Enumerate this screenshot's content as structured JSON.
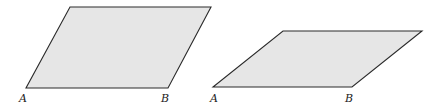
{
  "figure": {
    "fill_color": "#e6e6e6",
    "stroke_color": "#2a2a2a",
    "parallelograms": [
      {
        "id": "left",
        "points": "26,88 168,88 211,7 70,7",
        "labels": [
          {
            "text": "A",
            "x": 19,
            "y": 102
          },
          {
            "text": "B",
            "x": 161,
            "y": 102
          }
        ]
      },
      {
        "id": "right",
        "points": "213,87 352,87 422,31 283,31",
        "labels": [
          {
            "text": "A",
            "x": 210,
            "y": 102
          },
          {
            "text": "B",
            "x": 345,
            "y": 102
          }
        ]
      }
    ]
  }
}
